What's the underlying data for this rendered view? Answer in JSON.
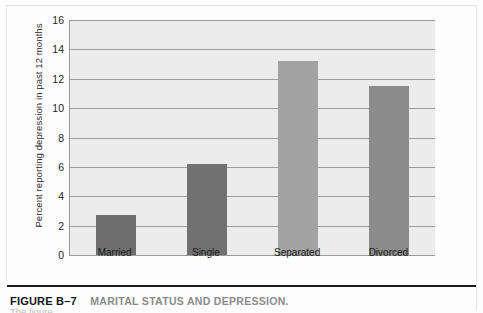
{
  "figure": {
    "caption_number": "FIGURE B–7",
    "caption_title": "MARITAL STATUS AND DEPRESSION.",
    "caption_body": "The figure"
  },
  "chart_data": {
    "type": "bar",
    "title": "MARITAL STATUS AND DEPRESSION.",
    "xlabel": "",
    "ylabel": "Percent reporting depression in past 12 months",
    "categories": [
      "Married",
      "Single",
      "Separated",
      "Divorced"
    ],
    "values": [
      2.7,
      6.2,
      13.2,
      11.5
    ],
    "bar_colors": [
      "#6e6e6e",
      "#717171",
      "#a2a2a2",
      "#8b8b8b"
    ],
    "ylim": [
      0,
      16
    ],
    "yticks": [
      0,
      2,
      4,
      6,
      8,
      10,
      12,
      14,
      16
    ],
    "ytick_labels": [
      "0",
      "2",
      "4",
      "6",
      "8",
      "10",
      "12",
      "14",
      "16"
    ],
    "grid": true,
    "grid_axis": "y",
    "legend": false,
    "plot_background": "#ececec",
    "axis_color": "#9a9a9a"
  }
}
